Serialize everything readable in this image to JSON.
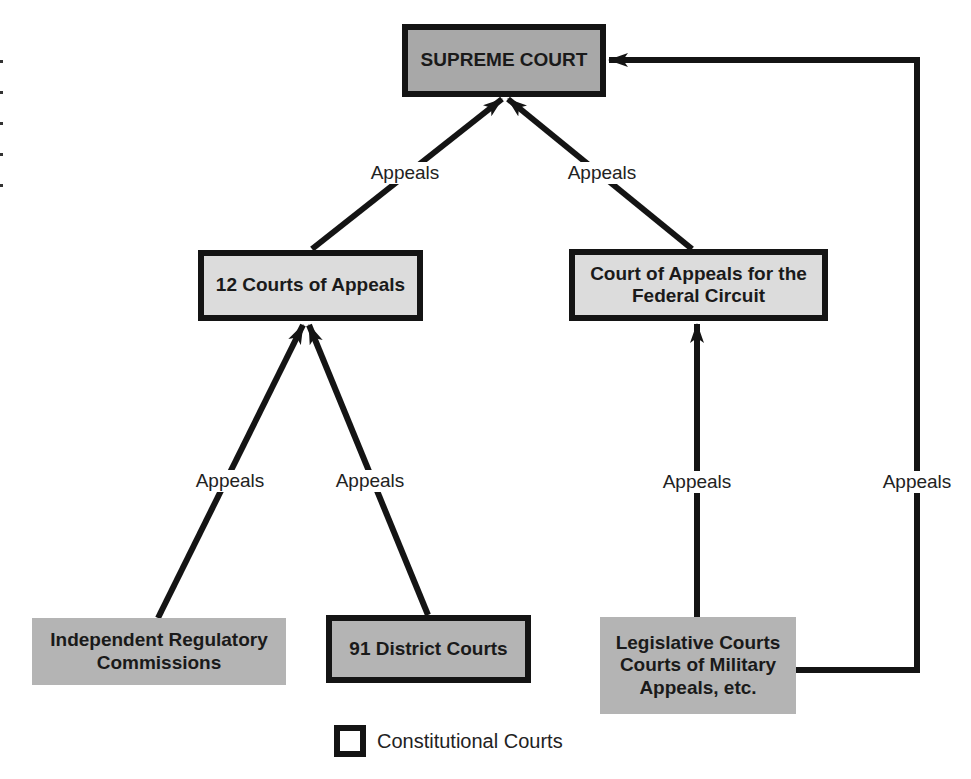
{
  "diagram": {
    "type": "hierarchy",
    "nodes": {
      "supreme": {
        "lines": [
          "SUPREME COURT"
        ],
        "fill": "#a8a8a8",
        "constitutional": true
      },
      "appeals12": {
        "lines": [
          "12 Courts of Appeals"
        ],
        "fill": "#dcdcdc",
        "constitutional": true
      },
      "federal": {
        "lines": [
          "Court of Appeals for the",
          "Federal Circuit"
        ],
        "fill": "#dcdcdc",
        "constitutional": true
      },
      "regulatory": {
        "lines": [
          "Independent Regulatory",
          "Commissions"
        ],
        "fill": "#b4b4b4",
        "constitutional": false
      },
      "district": {
        "lines": [
          "91 District Courts"
        ],
        "fill": "#b4b4b4",
        "constitutional": true
      },
      "legislative": {
        "lines": [
          "Legislative Courts",
          "Courts of Military",
          "Appeals, etc."
        ],
        "fill": "#b4b4b4",
        "constitutional": false
      }
    },
    "edges": [
      {
        "from": "appeals12",
        "to": "supreme",
        "label": "Appeals"
      },
      {
        "from": "federal",
        "to": "supreme",
        "label": "Appeals"
      },
      {
        "from": "regulatory",
        "to": "appeals12",
        "label": "Appeals"
      },
      {
        "from": "district",
        "to": "appeals12",
        "label": "Appeals"
      },
      {
        "from": "legislative",
        "to": "federal",
        "label": "Appeals"
      },
      {
        "from": "legislative",
        "to": "supreme",
        "label": "Appeals"
      }
    ],
    "legend": {
      "label": "Constitutional Courts"
    },
    "colors": {
      "line": "#141414",
      "text": "#1a1a1a"
    }
  }
}
